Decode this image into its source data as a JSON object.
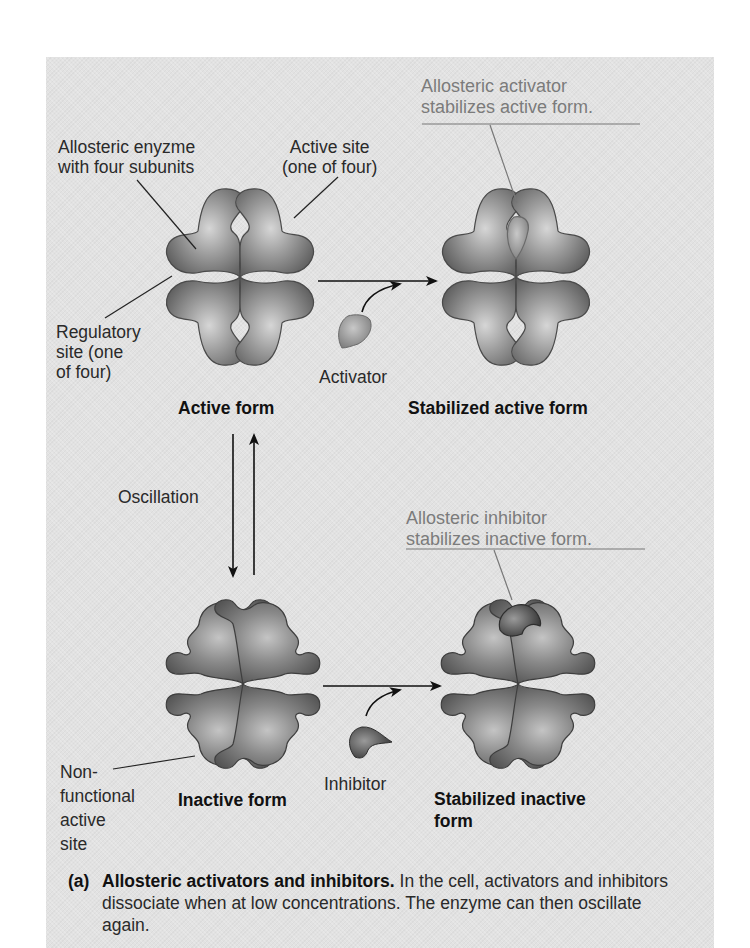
{
  "figure": {
    "labels": {
      "allosteric_enzyme": [
        "Allosteric enyzme",
        "with four subunits"
      ],
      "active_site": [
        "Active site",
        "(one of four)"
      ],
      "regulatory_site": [
        "Regulatory",
        "site (one",
        "of four)"
      ],
      "activator_stabilizes": [
        "Allosteric activator",
        "stabilizes active form."
      ],
      "inhibitor_stabilizes": [
        "Allosteric inhibitor",
        "stabilizes inactive form."
      ],
      "activator": "Activator",
      "inhibitor": "Inhibitor",
      "oscillation": "Oscillation",
      "nonfunctional_site": [
        "Non-",
        "functional",
        "active",
        "site"
      ]
    },
    "states": {
      "active_form": "Active form",
      "stabilized_active_form": "Stabilized active form",
      "inactive_form": "Inactive form",
      "stabilized_inactive_form": [
        "Stabilized inactive",
        "form"
      ]
    },
    "caption": {
      "tag": "(a)",
      "title": "Allosteric activators and inhibitors.",
      "body": " In the cell, activators and inhibitors dissociate when at low concentrations. The enzyme can then oscillate again."
    },
    "colors": {
      "panel_background": "#e2e2e2",
      "enzyme_fill": "#8a8a8a",
      "activator_fill": "#a6a6a6",
      "inhibitor_fill": "#5e5e5e",
      "callout_text": "#7b7b7b"
    }
  }
}
